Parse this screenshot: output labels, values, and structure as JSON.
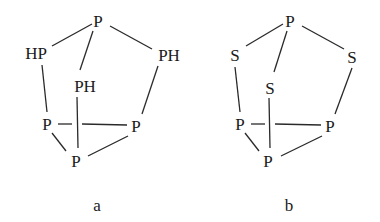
{
  "diagram": {
    "structures": [
      {
        "id": "a",
        "caption": "a",
        "atoms": {
          "top": "P",
          "left_upper": "HP",
          "right_upper": "PH",
          "middle": "PH",
          "left_lower": "P",
          "right_lower": "P",
          "bottom": "P"
        }
      },
      {
        "id": "b",
        "caption": "b",
        "atoms": {
          "top": "P",
          "left_upper": "S",
          "right_upper": "S",
          "middle": "S",
          "left_lower": "P",
          "right_lower": "P",
          "bottom": "P"
        }
      }
    ],
    "colors": {
      "ink": "#1a1a1a",
      "background": "#ffffff"
    }
  }
}
